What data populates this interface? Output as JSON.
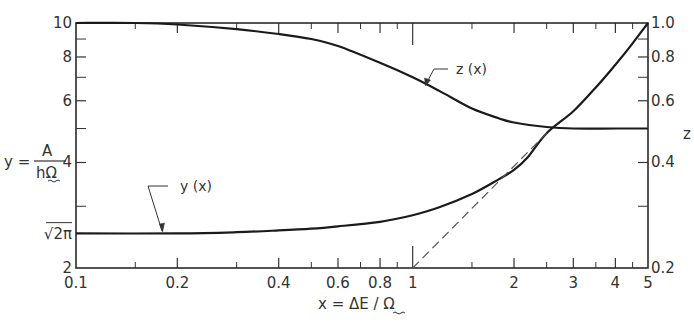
{
  "chart_data": {
    "type": "line",
    "title": "",
    "xlabel": "x = ΔE / Ω",
    "ylabel": "y = A / hΩ",
    "y2label": "z",
    "xscale": "log",
    "yscale": "log",
    "y2scale": "log",
    "xlim": [
      0.1,
      5
    ],
    "ylim": [
      2,
      10
    ],
    "y2lim": [
      0.2,
      1.0
    ],
    "grid": false,
    "legend": "inline labels with arrows",
    "x_ticks": [
      {
        "value": 0.1,
        "label": "0.1"
      },
      {
        "value": 0.2,
        "label": "0.2"
      },
      {
        "value": 0.4,
        "label": "0.4"
      },
      {
        "value": 0.6,
        "label": "0.6"
      },
      {
        "value": 0.8,
        "label": "0.8"
      },
      {
        "value": 1,
        "label": "1"
      },
      {
        "value": 2,
        "label": "2"
      },
      {
        "value": 3,
        "label": "3"
      },
      {
        "value": 4,
        "label": "4"
      },
      {
        "value": 5,
        "label": "5"
      }
    ],
    "x_minor_ticks": [
      0.15,
      0.3,
      0.5,
      0.7,
      0.9,
      1.5,
      2.5,
      3.5,
      4.5
    ],
    "y_ticks": [
      {
        "value": 10,
        "label": "10"
      },
      {
        "value": 8,
        "label": "8"
      },
      {
        "value": 6,
        "label": "6"
      },
      {
        "value": 4,
        "label": "4"
      },
      {
        "value": 2.5066,
        "label": "√2π"
      },
      {
        "value": 2,
        "label": "2"
      }
    ],
    "y_minor_ticks": [
      9,
      7,
      5,
      3
    ],
    "y2_ticks": [
      {
        "value": 1.0,
        "label": "1.0"
      },
      {
        "value": 0.8,
        "label": "0.8"
      },
      {
        "value": 0.6,
        "label": "0.6"
      },
      {
        "value": 0.4,
        "label": "0.4"
      },
      {
        "value": 0.2,
        "label": "0.2"
      }
    ],
    "y2_minor_ticks": [
      0.9,
      0.7,
      0.5,
      0.3
    ],
    "series": [
      {
        "name": "y(x)",
        "axis": "left",
        "style": "solid",
        "x": [
          0.1,
          0.2,
          0.3,
          0.4,
          0.5,
          0.6,
          0.8,
          1.0,
          1.2,
          1.5,
          1.8,
          2.0,
          2.2,
          2.5,
          3.0,
          3.5,
          4.0,
          4.5,
          5.0
        ],
        "values": [
          2.51,
          2.51,
          2.53,
          2.56,
          2.59,
          2.63,
          2.71,
          2.83,
          2.98,
          3.25,
          3.58,
          3.81,
          4.15,
          4.85,
          5.6,
          6.55,
          7.6,
          8.75,
          10.0
        ]
      },
      {
        "name": "z(x)",
        "axis": "right",
        "style": "solid",
        "x": [
          0.1,
          0.15,
          0.2,
          0.3,
          0.4,
          0.5,
          0.6,
          0.8,
          1.0,
          1.2,
          1.5,
          1.8,
          2.0,
          2.5,
          3.0,
          4.0,
          5.0
        ],
        "values": [
          1.0,
          1.0,
          0.99,
          0.96,
          0.93,
          0.9,
          0.86,
          0.77,
          0.7,
          0.64,
          0.57,
          0.535,
          0.52,
          0.505,
          0.5,
          0.5,
          0.5
        ]
      },
      {
        "name": "asymptote",
        "axis": "left",
        "style": "dashed",
        "x": [
          1.0,
          2.5
        ],
        "values": [
          2.0,
          4.85
        ]
      }
    ],
    "annotations": [
      {
        "text": "y (x)",
        "points_to": {
          "x": 0.19,
          "y": 2.51
        }
      },
      {
        "text": "z (x)",
        "points_to": {
          "x": 1.3,
          "z": 0.62
        }
      }
    ]
  },
  "labels": {
    "y_axis_prefix": "y =",
    "y_axis_numerator": "A",
    "y_axis_denominator": "hΩ",
    "x_axis_title": "x = ΔE / Ω",
    "z_axis_title": "z",
    "y_curve_label": "y (x)",
    "z_curve_label": "z (x)"
  }
}
